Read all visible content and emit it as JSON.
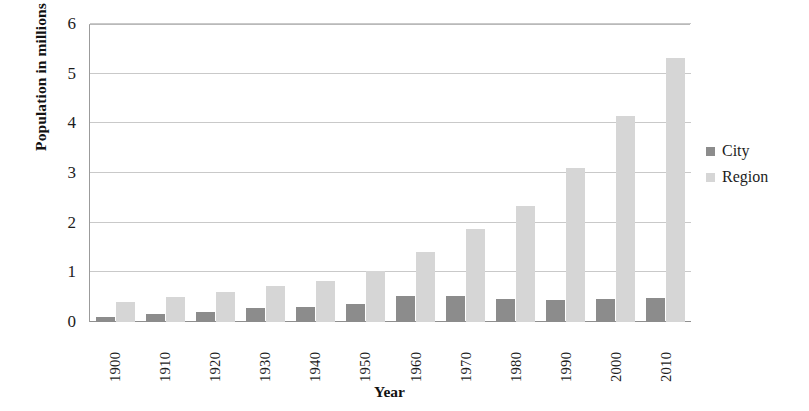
{
  "chart_data": {
    "type": "bar",
    "title": "",
    "xlabel": "Year",
    "ylabel": "Population in millions",
    "ylim": [
      0,
      6
    ],
    "yticks": [
      0,
      1,
      2,
      3,
      4,
      5,
      6
    ],
    "grid": true,
    "legend_position": "right",
    "categories": [
      "1900",
      "1910",
      "1920",
      "1930",
      "1940",
      "1950",
      "1960",
      "1970",
      "1980",
      "1990",
      "2000",
      "2010"
    ],
    "series": [
      {
        "name": "City",
        "color": "#8c8c8c",
        "values": [
          0.1,
          0.17,
          0.21,
          0.28,
          0.31,
          0.36,
          0.53,
          0.53,
          0.47,
          0.44,
          0.47,
          0.48
        ]
      },
      {
        "name": "Region",
        "color": "#d6d6d6",
        "values": [
          0.4,
          0.5,
          0.6,
          0.72,
          0.83,
          1.03,
          1.41,
          1.88,
          2.34,
          3.11,
          4.14,
          5.32
        ]
      }
    ]
  },
  "legend": {
    "items": [
      {
        "label": "City",
        "color": "#8c8c8c"
      },
      {
        "label": "Region",
        "color": "#d6d6d6"
      }
    ]
  }
}
